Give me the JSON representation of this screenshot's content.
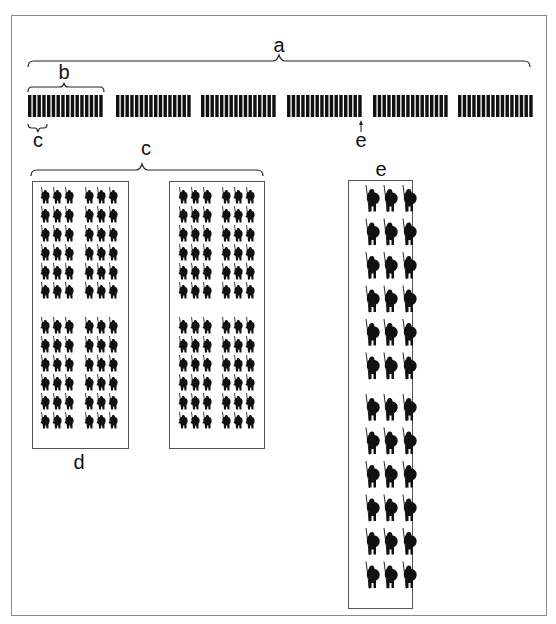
{
  "figure": {
    "labels": {
      "a": "a",
      "b": "b",
      "c_small": "c",
      "e_arrow": "e",
      "c_large": "c",
      "e_box": "e",
      "d": "d"
    },
    "colors": {
      "ink": "#111111",
      "frame": "#8a8a8a",
      "box_border": "#555555"
    },
    "icons": {
      "soldier": "soldier-icon"
    },
    "top_row": {
      "block_count": 6,
      "bars_per_block": 16,
      "arrow_target_block": 4
    },
    "unit_boxes": [
      {
        "name": "d",
        "groups": 2,
        "cols_per_group": 3,
        "rows_per_block": 6,
        "blocks": 2
      },
      {
        "name": "d-copy",
        "groups": 2,
        "cols_per_group": 3,
        "rows_per_block": 6,
        "blocks": 2
      },
      {
        "name": "e",
        "groups": 1,
        "cols_per_group": 3,
        "rows_per_block": 6,
        "blocks": 2
      }
    ]
  }
}
